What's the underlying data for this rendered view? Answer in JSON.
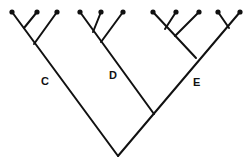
{
  "diagram": {
    "type": "cladogram",
    "colors": {
      "line": "#111111",
      "background": "#ffffff"
    },
    "clade_labels": [
      {
        "id": "C",
        "text": "C",
        "x": 41,
        "y": 76
      },
      {
        "id": "D",
        "text": "D",
        "x": 109,
        "y": 70
      },
      {
        "id": "E",
        "text": "E",
        "x": 193,
        "y": 77
      }
    ],
    "tips": [
      [
        12,
        12
      ],
      [
        37,
        12
      ],
      [
        57,
        12
      ],
      [
        80,
        12
      ],
      [
        101,
        12
      ],
      [
        123,
        12
      ],
      [
        153,
        12
      ],
      [
        176,
        12
      ],
      [
        199,
        12
      ],
      [
        218,
        12
      ],
      [
        240,
        12
      ]
    ],
    "branches": [
      [
        118,
        156,
        12,
        12
      ],
      [
        118,
        156,
        240,
        12
      ],
      [
        154,
        114,
        80,
        12
      ],
      [
        34,
        44,
        57,
        12
      ],
      [
        24,
        28,
        37,
        12
      ],
      [
        101,
        42,
        123,
        12
      ],
      [
        93,
        32,
        101,
        12
      ],
      [
        196,
        58,
        153,
        12
      ],
      [
        175,
        36,
        199,
        12
      ],
      [
        165,
        29,
        176,
        12
      ],
      [
        229,
        28,
        218,
        12
      ]
    ]
  }
}
